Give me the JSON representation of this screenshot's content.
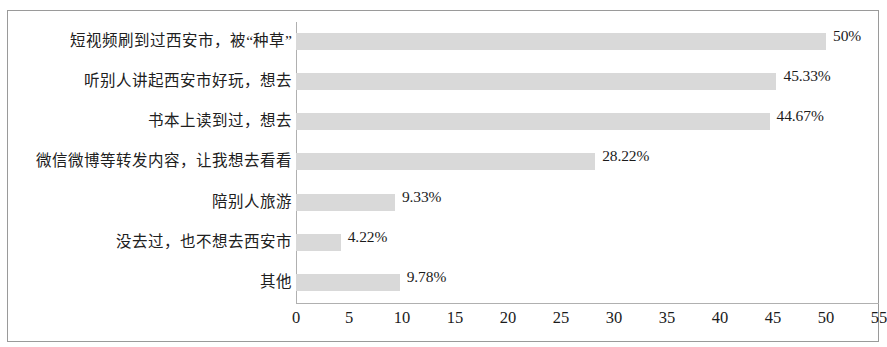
{
  "chart_data": {
    "type": "bar",
    "orientation": "horizontal",
    "title": "",
    "xlabel": "",
    "ylabel": "",
    "xlim": [
      0,
      55
    ],
    "xticks": [
      "0",
      "5",
      "10",
      "15",
      "20",
      "25",
      "30",
      "35",
      "40",
      "45",
      "50",
      "55"
    ],
    "xtick_values": [
      0,
      5,
      10,
      15,
      20,
      25,
      30,
      35,
      40,
      45,
      50,
      55
    ],
    "grid": false,
    "legend": false,
    "bar_color": "#d9d9d9",
    "axis_color": "#b0b0b0",
    "frame_color": "#9a9a9a",
    "categories": [
      "短视频刷到过西安市，被“种草”",
      "听别人讲起西安市好玩，想去",
      "书本上读到过，想去",
      "微信微博等转发内容，让我想去看看",
      "陪别人旅游",
      "没去过，也不想去西安市",
      "其他"
    ],
    "values": [
      50,
      45.33,
      44.67,
      28.22,
      9.33,
      4.22,
      9.78
    ],
    "value_labels": [
      "50%",
      "45.33%",
      "44.67%",
      "28.22%",
      "9.33%",
      "4.22%",
      "9.78%"
    ]
  }
}
